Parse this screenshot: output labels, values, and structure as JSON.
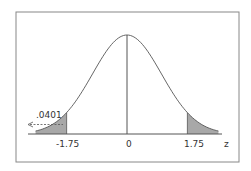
{
  "chart_data": {
    "type": "area",
    "title": "",
    "xlabel": "z",
    "ylabel": "",
    "distribution": "standard normal",
    "tick_labels": [
      "-1.75",
      "0",
      "1.75"
    ],
    "ticks": [
      -1.75,
      0,
      1.75
    ],
    "shaded_regions": [
      {
        "name": "left tail",
        "from": "-inf",
        "to": -1.75
      },
      {
        "name": "right tail",
        "from": 1.75,
        "to": "inf"
      }
    ],
    "annotations": [
      {
        "text": ".0401",
        "points_to": "left tail area",
        "style": "dashed arrow pointing left"
      }
    ],
    "grid": false,
    "legend": "none"
  },
  "labels": {
    "neg": "-1.75",
    "zero": "0",
    "pos": "1.75",
    "axis": "z",
    "area": ".0401"
  },
  "colors": {
    "curve": "#555555",
    "shade": "#a8a8a8",
    "frame": "#777777"
  }
}
